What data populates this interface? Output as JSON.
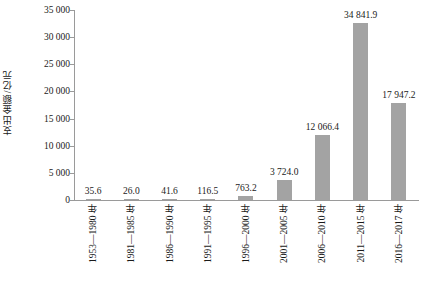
{
  "chart_data": {
    "type": "bar",
    "title": "",
    "xlabel": "",
    "ylabel": "支出金额/亿元",
    "ylim": [
      0,
      35000
    ],
    "yticks": [
      "0",
      "5 000",
      "10 000",
      "15 000",
      "20 000",
      "25 000",
      "30 000",
      "35 000"
    ],
    "ytick_values": [
      0,
      5000,
      10000,
      15000,
      20000,
      25000,
      30000,
      35000
    ],
    "grid": false,
    "legend": false,
    "bar_color": "#a3a3a3",
    "categories": [
      "1953—1980 年",
      "1981—1985 年",
      "1986—1990 年",
      "1991—1995 年",
      "1996—2000 年",
      "2001—2005 年",
      "2006—2010 年",
      "2011—2015 年",
      "2016—2017 年"
    ],
    "values": [
      35.6,
      26.0,
      41.6,
      116.5,
      763.2,
      3724.0,
      12066.4,
      34841.9,
      17947.2
    ],
    "value_labels": [
      "35.6",
      "26.0",
      "41.6",
      "116.5",
      "763.2",
      "3 724.0",
      "12 066.4",
      "34 841.9",
      "17 947.2"
    ]
  }
}
